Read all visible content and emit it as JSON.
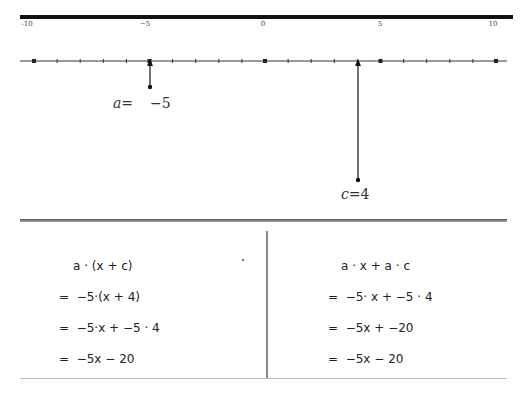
{
  "number_line": {
    "min": -10,
    "max": 10,
    "major_step": 5,
    "minor_step": 1,
    "labels": [
      {
        "value": -10,
        "text": "-10"
      },
      {
        "value": -5,
        "text": "−5"
      },
      {
        "value": 0,
        "text": "0"
      },
      {
        "value": 5,
        "text": "5"
      },
      {
        "value": 10,
        "text": "10"
      }
    ],
    "points": {
      "a": {
        "name": "a",
        "equals": "=",
        "value_text": "−5",
        "value": -5
      },
      "c": {
        "name": "c",
        "equals": "=",
        "value_text": "4",
        "value": 4
      }
    }
  },
  "left_panel": {
    "header": "a · (x + c)",
    "steps": [
      "=  −5·(x + 4)",
      "=  −5·x + −5 · 4",
      "=  −5x − 20"
    ]
  },
  "right_panel": {
    "header": "a · x + a · c",
    "steps": [
      "=  −5· x + −5 · 4",
      "=  −5x + −20",
      "=  −5x − 20"
    ]
  }
}
